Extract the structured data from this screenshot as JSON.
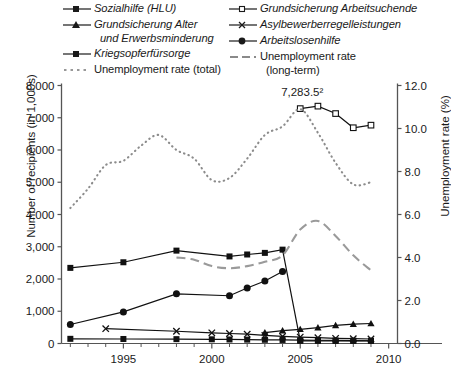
{
  "legend": {
    "left_column": [
      {
        "label": "Sozialhilfe (HLU)",
        "marker": "square-filled",
        "italic": true
      },
      {
        "label": "Grundsicherung Alter",
        "sub": "und Erwerbsminderung",
        "marker": "triangle-filled",
        "italic": true
      },
      {
        "label": "Kriegsopferfürsorge",
        "marker": "square-filled",
        "italic": true
      },
      {
        "label": "Unemployment rate (total)",
        "marker": "dotted-line",
        "italic": false
      }
    ],
    "right_column": [
      {
        "label": "Grundsicherung Arbeitsuchende",
        "marker": "square-open",
        "italic": true
      },
      {
        "label": "Asylbewerberregelleistungen",
        "marker": "cross",
        "italic": true
      },
      {
        "label": "Arbeitslosenhilfe",
        "marker": "circle-filled",
        "italic": true
      },
      {
        "label": "Unemployment rate",
        "sub": "(long-term)",
        "marker": "dashed-line",
        "italic": false
      }
    ]
  },
  "chart_data": {
    "type": "line",
    "title": "",
    "xlabel": "",
    "ylabel": "Number of recipients (in 1,000s)",
    "y2label": "Unemployment rate (%)",
    "xlim": [
      1991.5,
      2010.5
    ],
    "ylim": [
      0,
      8000
    ],
    "y2lim": [
      0.0,
      12.0
    ],
    "grid": false,
    "legend_position": "top",
    "x_ticks": [
      1995,
      2000,
      2005,
      2010
    ],
    "x_minor_ticks": [
      1992,
      1993,
      1994,
      1996,
      1997,
      1998,
      1999,
      2001,
      2002,
      2003,
      2004,
      2006,
      2007,
      2008,
      2009
    ],
    "y_ticks": [
      0,
      1000,
      2000,
      3000,
      4000,
      5000,
      6000,
      7000,
      8000
    ],
    "y_tick_labels": [
      "0",
      "1,000",
      "2,000",
      "3,000",
      "4,000",
      "5,000",
      "6,000",
      "7,000",
      "8,000"
    ],
    "y2_ticks": [
      0.0,
      2.0,
      4.0,
      6.0,
      8.0,
      10.0,
      12.0
    ],
    "y2_tick_labels": [
      "0.0",
      "2.0",
      "4.0",
      "6.0",
      "8.0",
      "10.0",
      "12.0"
    ],
    "annotations": [
      {
        "text": "7,283.5²",
        "x": 2005,
        "y": 7283.5,
        "series": "Grundsicherung Arbeitsuchende"
      }
    ],
    "series": [
      {
        "name": "Sozialhilfe (HLU)",
        "axis": "left",
        "marker": "square-filled",
        "style": "solid",
        "x": [
          1992,
          1995,
          1998,
          2001,
          2002,
          2003,
          2004,
          2005,
          2006,
          2007,
          2008,
          2009
        ],
        "values": [
          2345,
          2519,
          2880,
          2700,
          2760,
          2810,
          2910,
          82,
          82,
          80,
          80,
          80
        ]
      },
      {
        "name": "Arbeitslosenhilfe",
        "axis": "left",
        "marker": "circle-filled",
        "style": "solid",
        "x": [
          1992,
          1995,
          1998,
          2001,
          2002,
          2003,
          2004
        ],
        "values": [
          590,
          980,
          1540,
          1480,
          1720,
          1940,
          2230
        ]
      },
      {
        "name": "Grundsicherung Arbeitsuchende",
        "axis": "left",
        "marker": "square-open",
        "style": "solid",
        "x": [
          2005,
          2006,
          2007,
          2008,
          2009
        ],
        "values": [
          7283.5,
          7360,
          7130,
          6690,
          6770
        ]
      },
      {
        "name": "Grundsicherung Alter und Erwerbsminderung",
        "axis": "left",
        "marker": "triangle-filled",
        "style": "solid",
        "x": [
          2003,
          2004,
          2005,
          2006,
          2007,
          2008,
          2009
        ],
        "values": [
          340,
          400,
          440,
          490,
          560,
          600,
          620
        ]
      },
      {
        "name": "Asylbewerberregelleistungen",
        "axis": "left",
        "marker": "cross",
        "style": "solid",
        "x": [
          1994,
          1998,
          2000,
          2001,
          2002,
          2003,
          2004,
          2005,
          2006,
          2007,
          2008,
          2009
        ],
        "values": [
          460,
          380,
          330,
          310,
          290,
          250,
          220,
          200,
          180,
          160,
          150,
          140
        ]
      },
      {
        "name": "Kriegsopferfürsorge",
        "axis": "left",
        "marker": "square-filled",
        "style": "solid",
        "x": [
          1992,
          1995,
          1998,
          2000,
          2001,
          2002,
          2003,
          2004,
          2005,
          2006,
          2007,
          2008,
          2009
        ],
        "values": [
          145,
          140,
          135,
          130,
          125,
          120,
          115,
          110,
          105,
          100,
          95,
          90,
          85
        ]
      },
      {
        "name": "Unemployment rate (total)",
        "axis": "right",
        "marker": "none",
        "style": "dotted",
        "x": [
          1992,
          1993,
          1994,
          1995,
          1996,
          1997,
          1998,
          1999,
          2000,
          2001,
          2002,
          2003,
          2004,
          2005,
          2006,
          2007,
          2008,
          2009
        ],
        "values": [
          6.3,
          7.2,
          8.3,
          8.5,
          9.2,
          9.7,
          9.0,
          8.6,
          7.6,
          7.7,
          8.6,
          9.7,
          10.1,
          10.9,
          9.8,
          8.4,
          7.4,
          7.5
        ]
      },
      {
        "name": "Unemployment rate (long-term)",
        "axis": "right",
        "marker": "none",
        "style": "dashed",
        "x": [
          1998,
          1999,
          2000,
          2001,
          2002,
          2003,
          2004,
          2005,
          2006,
          2007,
          2008,
          2009
        ],
        "values": [
          4.0,
          3.9,
          3.6,
          3.5,
          3.6,
          3.8,
          4.1,
          5.3,
          5.7,
          5.0,
          4.1,
          3.4
        ]
      }
    ]
  }
}
